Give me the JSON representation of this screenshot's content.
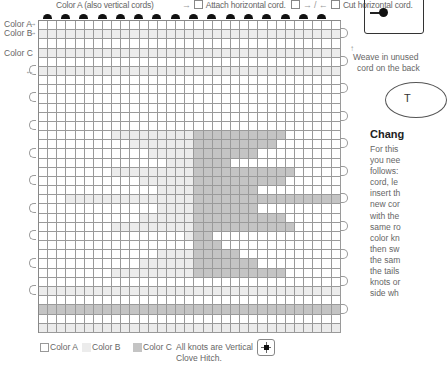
{
  "header": {
    "color_a_caption": "Color A (also vertical cords)",
    "attach_arrow": "→",
    "attach_label": "Attach horizontal cord.",
    "cut_arrows": "→ / ←",
    "cut_label": "Cut horizontal cord."
  },
  "row_labels": {
    "color_a": "Color A",
    "color_b": "Color B",
    "color_c": "Color C"
  },
  "side_note": {
    "weave_line1": "Weave in unused",
    "weave_line2": "cord on the back"
  },
  "side_panel": {
    "title": "Chang",
    "body": [
      "For this",
      "you nee",
      "follows:",
      "cord, le",
      "insert th",
      "new cor",
      "with the",
      "same ro",
      "color kn",
      "then sw",
      "the sam",
      "the tails",
      "knots or",
      "side wh"
    ]
  },
  "legend": {
    "color_a": "Color A",
    "color_b": "Color B",
    "color_c": "Color C",
    "note_line1": "All knots are Vertical",
    "note_line2": "Clove Hitch."
  },
  "icons": {
    "knot_symbol": "vertical-clove-hitch-icon"
  },
  "colors": {
    "color_a": "#ffffff",
    "color_b": "#ececec",
    "color_c": "#c4c4c4",
    "grid_line": "#9a9a9a",
    "knot": "#111111"
  },
  "grid": {
    "columns": 33,
    "rows": [
      "AAAAAAAAAAAAAAAAAAAAAAAAAAAAAAAAA",
      "BBBBBBBBBBBBBBBBBBBBBBBBBBBBBBBBB",
      "AAAAAAAAAAAAAAAAAAAAAAAAAAAAAAAAA",
      "BBBBBBBBBBBBBBBBBBBBBBBBBBBBBBBBB",
      "AAAAAAAAAAAAAAAAAAAAAAAAAAAAAAAAA",
      "BBBBBBBBBBBBBBBBBBBBBBBBBBBBBBBBB",
      "AAAAAAAAAAAAAAAAAAAAAAAAAAAAAAAAA",
      "AAAAAAAAAAAAAAAAAAAAAAAAAAAAAAAAA",
      "AAAAAAAAAAAAAAAAAAAAAAAAAAAAAAAAA",
      "AAAAAAAAAAAAAAAAAAAAAAAAAAAAAAAAA",
      "AAAAAAAAAAAAAAAAAAAAAAAAAAAAAAAAA",
      "AAAAAAAAAAAAAAAAAAAAAAAAAAAAAAAAA",
      "AAAAAAAABBBBBBBBBCCCCCCCCCCAAAAAA",
      "AAAAAAAAAABBBBBBBCCCCCCCCCAAAAAAA",
      "AAAAAAAAAAAABBBBBCCCCCCCAAAAAAAAA",
      "AAAAAAAAAAAAAABBBCCCCAAAAAAAAAAAA",
      "AAAAAAAABBBBBBBBBCCCCCCCCCCCAAAAA",
      "AAAAAAAAAAABBBBBBCCCCCCCCCCAAAAAA",
      "AAAAAAAAAAAAABBBBCCCCCCCAAAAAAAAA",
      "AAABBBBBBBBBBBBBBCCCCCCCCCCCCCCCC",
      "AAAAAAAAAAAAABBBBCCCCCCCAAAAAAAAA",
      "AAAAAAAAAAABBBBBBCCCCCCCCCCAAAAAA",
      "AAAAAAAABBBBBBBBBCCCCCCCCCCCAAAAA",
      "AAAAAAAAAAAAAAAABCCAAAAAAAAAAAAAA",
      "AAAAAAAAAAAAAAAAACCCAAAAAAAAAAAAA",
      "AAAAAAAAAAAAABBBBCCCCCAAAAAAAAAAA",
      "AAAAAAAAAAABBBBBBCCCCCCCAAAAAAAAA",
      "AAAAAAAABBBBBBBBBCCCCCCCCCCAAAAAA",
      "AAAAAAAAAAAAAAAAAAAAAAAAAAAAAAAAA",
      "BBBBBBBBBBBBBBBBBBBBBBBBBBBBBBBBB",
      "AAAAAAAAAAAAAAAAAAAAAAAAAAAAAAAAA",
      "CCCCCCCCCCCCCCCCCCCCCCCCCCCCCCCCC",
      "AAAAAAAAAAAAAAAAAAAAAAAAAAAAAAAAA",
      "BBBBBBBBBBBBBBBBBBBBBBBBBBBBBBBBB"
    ]
  }
}
